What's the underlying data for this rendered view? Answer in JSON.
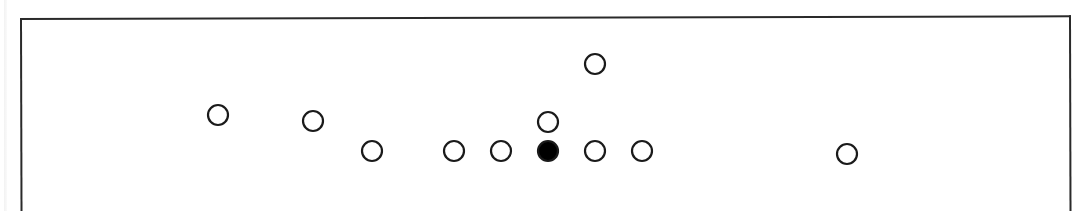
{
  "diagram": {
    "type": "formation",
    "frame": {
      "x": 20,
      "y": 18,
      "width": 1051,
      "stroke": "#2a2a2a"
    },
    "marker_radius": 10,
    "marker_stroke_width": 2.2,
    "colors": {
      "stroke": "#1a1a1a",
      "open_fill": "#ffffff",
      "filled": "#000000"
    },
    "markers": [
      {
        "id": "p1",
        "x": 218,
        "y": 115,
        "filled": false
      },
      {
        "id": "p2",
        "x": 313,
        "y": 121,
        "filled": false
      },
      {
        "id": "p3",
        "x": 372,
        "y": 151,
        "filled": false
      },
      {
        "id": "p4",
        "x": 454,
        "y": 151,
        "filled": false
      },
      {
        "id": "p5",
        "x": 501,
        "y": 151,
        "filled": false
      },
      {
        "id": "center",
        "x": 548,
        "y": 151,
        "filled": true
      },
      {
        "id": "p6",
        "x": 548,
        "y": 122,
        "filled": false
      },
      {
        "id": "p7",
        "x": 595,
        "y": 151,
        "filled": false
      },
      {
        "id": "p8",
        "x": 642,
        "y": 151,
        "filled": false
      },
      {
        "id": "p9",
        "x": 595,
        "y": 64,
        "filled": false
      },
      {
        "id": "p10",
        "x": 847,
        "y": 154,
        "filled": false
      }
    ]
  }
}
